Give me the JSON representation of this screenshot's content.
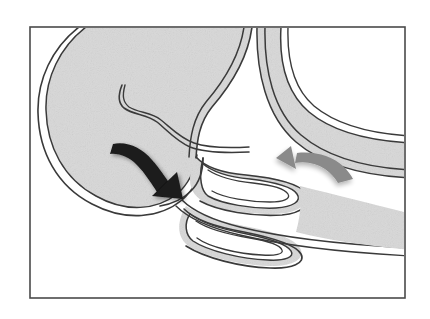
{
  "figure": {
    "kind": "anatomical-line-diagram",
    "caption": "",
    "canvas": {
      "width": 430,
      "height": 319
    },
    "frame": {
      "name": "figure-border",
      "x": 30,
      "y": 27,
      "width": 375,
      "height": 271,
      "stroke": "#4a4a4a",
      "stroke_width": 1.6,
      "fill": "#ffffff"
    },
    "palette": {
      "background": "#ffffff",
      "tissue_fill": "#d8d8d8",
      "tissue_fill_shaded": "#d2d2d2",
      "wall_stroke": "#3a3a3a",
      "lumen_white": "#ffffff",
      "black_arrow": "#1a1a1a",
      "gray_arrow": "#8a8a8a",
      "frame_stroke": "#4a4a4a"
    },
    "structures": [
      {
        "name": "stomach-antrum-body",
        "label": "Stomach (antrum and body)",
        "fill": "tissue_fill",
        "stroke": "wall_stroke",
        "wall_style": "double-line"
      },
      {
        "name": "duodenum",
        "label": "Duodenum (descending limb)",
        "fill": "tissue_fill",
        "stroke": "wall_stroke",
        "wall_style": "double-line"
      },
      {
        "name": "pylorus",
        "label": "Pyloric channel",
        "note": "narrowed junction between stomach and duodenum"
      },
      {
        "name": "prolapsed-mucosal-fold-upper",
        "label": "Prolapsed gastric mucosal fold (upper limb)"
      },
      {
        "name": "prolapsed-mucosal-fold-lower",
        "label": "Prolapsed gastric mucosal fold (lower limb)"
      },
      {
        "name": "gastric-mucosal-fold-interior",
        "label": "Gastric mucosal fold within stomach lumen"
      }
    ],
    "annotations": [
      {
        "name": "antegrade-flow-arrow",
        "shape": "curved-arrow",
        "color": "#1a1a1a",
        "direction": "down-right",
        "meaning": "Antegrade movement of gastric contents toward the pylorus"
      },
      {
        "name": "retrograde-flow-arrow",
        "shape": "curved-arrow",
        "color": "#8a8a8a",
        "direction": "left",
        "meaning": "Retrograde direction within the duodenum"
      }
    ]
  }
}
